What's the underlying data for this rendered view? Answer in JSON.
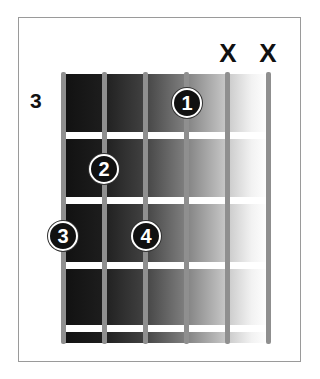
{
  "diagram": {
    "type": "guitar-chord-chart",
    "fret_position_label": "3",
    "strings": 6,
    "frets_shown": 4,
    "muted_strings": [
      {
        "string_index": 5,
        "label": "X"
      },
      {
        "string_index": 6,
        "label": "X"
      }
    ],
    "fingers": [
      {
        "finger": "1",
        "string_index": 4,
        "fret": 1
      },
      {
        "finger": "2",
        "string_index": 2,
        "fret": 2
      },
      {
        "finger": "3",
        "string_index": 1,
        "fret": 3
      },
      {
        "finger": "4",
        "string_index": 3,
        "fret": 3
      }
    ],
    "colors": {
      "frame": "#9a9a9a",
      "string": "#8f8f8f",
      "fret": "#ffffff",
      "dot_fill": "#111111",
      "dot_text": "#ffffff"
    }
  }
}
